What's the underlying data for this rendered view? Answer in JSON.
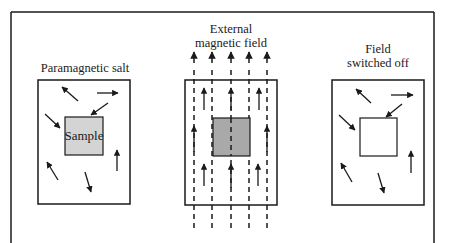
{
  "diagram": {
    "panels": [
      {
        "id": "before",
        "title_lines": [
          "Paramagnetic salt"
        ],
        "sample_label": "Sample",
        "sample_state": "random",
        "sample_fill": "#d4d4d4"
      },
      {
        "id": "field-on",
        "title_lines": [
          "External",
          "magnetic field"
        ],
        "sample_label": "",
        "sample_state": "aligned",
        "sample_fill": "#a9a9a9"
      },
      {
        "id": "field-off",
        "title_lines": [
          "Field",
          "switched off"
        ],
        "sample_label": "",
        "sample_state": "random",
        "sample_fill": "#ffffff"
      }
    ],
    "field_line_count": 5,
    "colors": {
      "stroke": "#1a1a1a",
      "background": "#ffffff"
    }
  }
}
